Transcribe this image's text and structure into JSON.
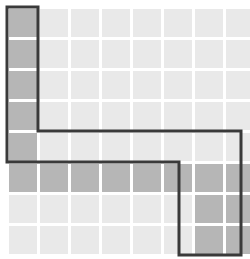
{
  "figure": {
    "type": "cell-grid",
    "background_color": "#ffffff"
  },
  "grid": {
    "columns": 8,
    "rows": 8,
    "cell_width": 28,
    "cell_height": 28,
    "gap": 3,
    "origin_x": 9,
    "origin_y": 9,
    "plain_cell_color": "#e9e9e9",
    "highlight_cell_color": "#b6b6b6",
    "gap_color": "#ffffff"
  },
  "outline": {
    "stroke_color": "#3a3a3a",
    "stroke_width": 3,
    "corner_radius": 2,
    "closed": true,
    "label": "path-outline"
  },
  "highlighted_cells": [
    {
      "col": 0,
      "row": 0
    },
    {
      "col": 0,
      "row": 1
    },
    {
      "col": 0,
      "row": 2
    },
    {
      "col": 0,
      "row": 3
    },
    {
      "col": 0,
      "row": 4
    },
    {
      "col": 0,
      "row": 5
    },
    {
      "col": 1,
      "row": 5
    },
    {
      "col": 2,
      "row": 5
    },
    {
      "col": 3,
      "row": 5
    },
    {
      "col": 4,
      "row": 5
    },
    {
      "col": 5,
      "row": 5
    },
    {
      "col": 6,
      "row": 5
    },
    {
      "col": 7,
      "row": 5
    },
    {
      "col": 6,
      "row": 6
    },
    {
      "col": 7,
      "row": 6
    },
    {
      "col": 6,
      "row": 7
    },
    {
      "col": 7,
      "row": 7
    }
  ],
  "outline_path_points": [
    {
      "x": 7,
      "y": 7
    },
    {
      "x": 38,
      "y": 7
    },
    {
      "x": 38,
      "y": 131
    },
    {
      "x": 241,
      "y": 131
    },
    {
      "x": 241,
      "y": 255
    },
    {
      "x": 179,
      "y": 255
    },
    {
      "x": 179,
      "y": 162
    },
    {
      "x": 7,
      "y": 162
    }
  ]
}
